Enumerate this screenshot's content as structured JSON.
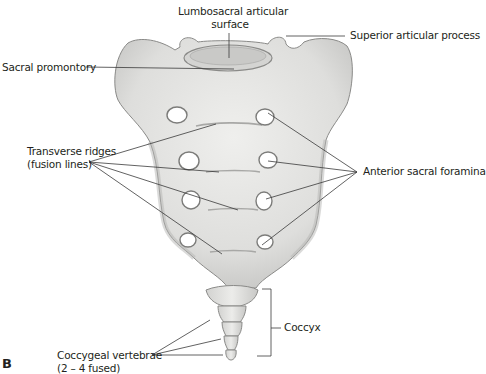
{
  "figure": {
    "panel_letter": "B"
  },
  "labels": {
    "lumbosacral_line1": "Lumbosacral articular",
    "lumbosacral_line2": "surface",
    "superior_articular_process": "Superior articular process",
    "sacral_promontory": "Sacral promontory",
    "transverse_ridges_line1": "Transverse ridges",
    "transverse_ridges_line2": "(fusion lines)",
    "anterior_sacral_foramina": "Anterior sacral foramina",
    "coccyx": "Coccyx",
    "coccygeal_line1": "Coccygeal vertebrae",
    "coccygeal_line2": "(2 – 4 fused)"
  },
  "colors": {
    "bone": "#e6e6e4",
    "bone_shadow": "#b9b9b7",
    "outline": "#8a8a88",
    "leader": "#3a3a3a",
    "text": "#231f20"
  }
}
